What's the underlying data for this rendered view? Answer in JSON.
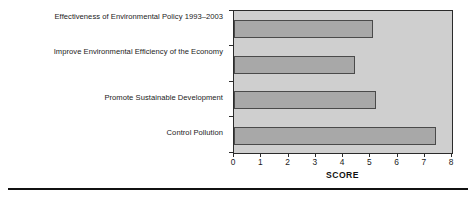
{
  "chart_data": {
    "type": "bar",
    "orientation": "horizontal",
    "title": "",
    "xlabel": "SCORE",
    "ylabel": "",
    "categories": [
      "Effectiveness of Environmental Policy 1993–2003",
      "Improve Environmental Efficiency of the Economy",
      "Promote Sustainable Development",
      "Control Pollution"
    ],
    "values": [
      5.1,
      4.45,
      5.2,
      7.4
    ],
    "xlim": [
      0,
      8
    ],
    "xticks": [
      "0",
      "1",
      "2",
      "3",
      "4",
      "5",
      "6",
      "7",
      "8"
    ],
    "grid": false,
    "legend": null,
    "colors": {
      "bar_fill": "#a8a8a8",
      "bar_border": "#4a4a4a",
      "plot_background": "#cfcfcf",
      "frame": "#2b2b2b",
      "text": "#1a1a1a"
    }
  }
}
